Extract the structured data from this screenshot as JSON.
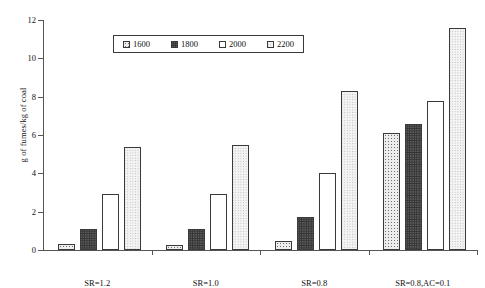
{
  "chart_data": {
    "type": "bar",
    "title": "",
    "xlabel": "",
    "ylabel": "g of fumes/kg of coal",
    "ylim": [
      0,
      12
    ],
    "yticks": [
      0,
      2,
      4,
      6,
      8,
      10,
      12
    ],
    "ytick_labels": [
      "0",
      "2",
      "4",
      "6",
      "8",
      "10",
      "12"
    ],
    "grid": false,
    "legend_position": "top-center",
    "categories": [
      "SR=1.2",
      "SR=1.0",
      "SR=0.8",
      "SR=0.8,AC=0.1"
    ],
    "series": [
      {
        "name": "1600",
        "values": [
          0.3,
          0.25,
          0.45,
          6.1
        ]
      },
      {
        "name": "1800",
        "values": [
          1.1,
          1.1,
          1.7,
          6.55
        ]
      },
      {
        "name": "2000",
        "values": [
          2.9,
          2.9,
          4.0,
          7.8
        ]
      },
      {
        "name": "2200",
        "values": [
          5.35,
          5.5,
          8.3,
          11.6
        ]
      }
    ]
  },
  "legend": {
    "entries": [
      {
        "label": "1600",
        "swatch": "swatch-1600"
      },
      {
        "label": "1800",
        "swatch": "swatch-1800"
      },
      {
        "label": "2000",
        "swatch": "swatch-2000"
      },
      {
        "label": "2200",
        "swatch": "swatch-2200"
      }
    ]
  }
}
